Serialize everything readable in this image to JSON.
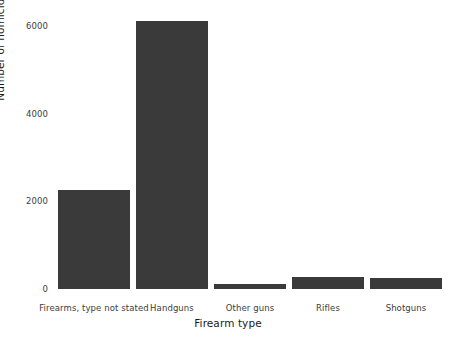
{
  "chart_data": {
    "type": "bar",
    "title": "",
    "subtitle": "",
    "xlabel": "Firearm type",
    "ylabel": "Number of homicides committed",
    "categories": [
      "Firearms, type not stated",
      "Handguns",
      "Other guns",
      "Rifles",
      "Shotguns"
    ],
    "values": [
      2250,
      6120,
      115,
      275,
      250
    ],
    "ylim": [
      0,
      6600
    ],
    "yticks": [
      0,
      2000,
      4000,
      6000
    ],
    "ytick_labels": [
      "0",
      "2000",
      "4000",
      "6000"
    ],
    "grid": false,
    "legend": null,
    "bar_color": "#3a3a3a",
    "background_color": "#ffffff",
    "axis_text_color": "#3d3d3d",
    "axis_title_color": "#1a1a1a"
  }
}
